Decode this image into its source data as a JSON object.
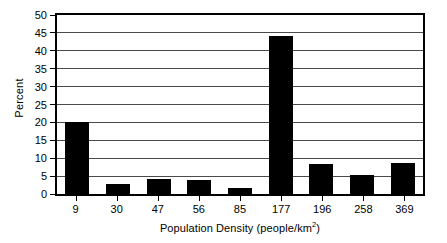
{
  "chart_data": {
    "type": "bar",
    "title": "",
    "xlabel": "Population Density (people/km2)",
    "xlabel_prefix": "Population Density (people/km",
    "xlabel_superscript": "2",
    "xlabel_suffix": ")",
    "ylabel": "Percent",
    "categories": [
      "9",
      "30",
      "47",
      "56",
      "85",
      "177",
      "196",
      "258",
      "369"
    ],
    "values": [
      20.2,
      2.9,
      4.3,
      3.8,
      1.7,
      44.2,
      8.4,
      5.3,
      8.8
    ],
    "ylim": [
      0,
      50
    ],
    "ytick_step": 5,
    "yticks": [
      "0",
      "5",
      "10",
      "15",
      "20",
      "25",
      "30",
      "35",
      "40",
      "45",
      "50"
    ],
    "grid": true,
    "grid_axis": "y",
    "legend": "none",
    "bar_color": "#000000",
    "grid_color": "#4a4a4a",
    "frame_color": "#000000",
    "background_color": "#ffffff"
  }
}
